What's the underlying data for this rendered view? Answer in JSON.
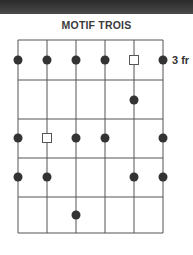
{
  "title": "MOTIF TROIS",
  "fret_label": "3 fr",
  "diagram": {
    "strings": 6,
    "frets": 5,
    "string_x": [
      18,
      47,
      76,
      105,
      134,
      163
    ],
    "fret_y": [
      40,
      80,
      119,
      158,
      197,
      233
    ],
    "row_y": [
      60,
      100,
      138,
      177,
      215
    ],
    "line_color": "#555555",
    "dot_color": "#333333",
    "markers": [
      {
        "row": 0,
        "string": 0,
        "type": "dot"
      },
      {
        "row": 0,
        "string": 1,
        "type": "dot"
      },
      {
        "row": 0,
        "string": 2,
        "type": "dot"
      },
      {
        "row": 0,
        "string": 3,
        "type": "dot"
      },
      {
        "row": 0,
        "string": 4,
        "type": "square"
      },
      {
        "row": 0,
        "string": 5,
        "type": "dot"
      },
      {
        "row": 1,
        "string": 4,
        "type": "dot"
      },
      {
        "row": 2,
        "string": 0,
        "type": "dot"
      },
      {
        "row": 2,
        "string": 1,
        "type": "square"
      },
      {
        "row": 2,
        "string": 2,
        "type": "dot"
      },
      {
        "row": 2,
        "string": 3,
        "type": "dot"
      },
      {
        "row": 2,
        "string": 5,
        "type": "dot"
      },
      {
        "row": 3,
        "string": 0,
        "type": "dot"
      },
      {
        "row": 3,
        "string": 1,
        "type": "dot"
      },
      {
        "row": 3,
        "string": 4,
        "type": "dot"
      },
      {
        "row": 3,
        "string": 5,
        "type": "dot"
      },
      {
        "row": 4,
        "string": 2,
        "type": "dot"
      }
    ]
  }
}
